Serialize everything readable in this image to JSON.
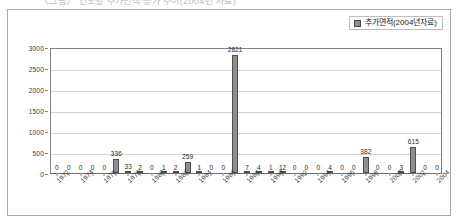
{
  "top_sliver": {
    "text": "〈그림〉 연도별 추가면적 증가 추이(2004년 자료)"
  },
  "legend": {
    "label": "추가면적(2004년자료)",
    "swatch_color": "#8c8c8c",
    "position": "top-right"
  },
  "axis": {
    "y_ticks": [
      "0",
      "500",
      "1000",
      "1500",
      "2000",
      "2500",
      "3000"
    ],
    "x_tick_labels": [
      "1972",
      "1974",
      "1976",
      "1978",
      "1980",
      "1982",
      "1984",
      "1986",
      "1988",
      "1990",
      "1992",
      "1994",
      "1996",
      "1998",
      "2000",
      "2002",
      "2004"
    ]
  },
  "chart_data": {
    "type": "bar",
    "title": "",
    "xlabel": "",
    "ylabel": "",
    "ylim": [
      0,
      3000
    ],
    "ytick_step": 500,
    "grid": true,
    "legend_position": "top-right",
    "series_name": "추가면적(2004년자료)",
    "bar_color": "#8e8e8e",
    "bar_border_color": "#4d4d4d",
    "categories": [
      "1972",
      "1973",
      "1974",
      "1975",
      "1976",
      "1977",
      "1978",
      "1979",
      "1980",
      "1981",
      "1982",
      "1983",
      "1984",
      "1985",
      "1986",
      "1987",
      "1988",
      "1989",
      "1990",
      "1991",
      "1992",
      "1993",
      "1994",
      "1995",
      "1996",
      "1997",
      "1998",
      "1999",
      "2000",
      "2001",
      "2002",
      "2003",
      "2004"
    ],
    "values": [
      0,
      0,
      0,
      0,
      0,
      336,
      33,
      2,
      0,
      1,
      2,
      259,
      1,
      0,
      0,
      2821,
      7,
      4,
      1,
      12,
      0,
      0,
      0,
      4,
      0,
      0,
      382,
      0,
      0,
      3,
      615,
      0,
      0
    ],
    "data_labels": [
      "0",
      "0",
      "0",
      "0",
      "0",
      "336",
      "33",
      "2",
      "0",
      "1",
      "2",
      "259",
      "1",
      "0",
      "0",
      "2821",
      "7",
      "4",
      "1",
      "12",
      "0",
      "0",
      "0",
      "4",
      "0",
      "0",
      "382",
      "0",
      "0",
      "3",
      "615",
      "0",
      "0"
    ],
    "labeled_x_ticks": [
      "1972",
      "1974",
      "1976",
      "1978",
      "1980",
      "1982",
      "1984",
      "1986",
      "1988",
      "1990",
      "1992",
      "1994",
      "1996",
      "1998",
      "2000",
      "2002",
      "2004"
    ]
  }
}
